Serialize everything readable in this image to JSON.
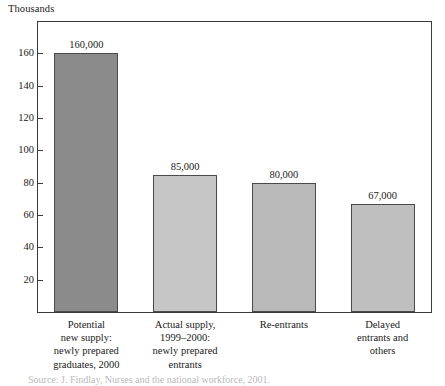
{
  "figure": {
    "units_label": "Thousands",
    "source_note": "Source: J. Findlay, Nurses and the national workforce, 2001.",
    "frame_color": "#3a3a3a"
  },
  "chart_data": {
    "type": "bar",
    "title": "",
    "subtitle": "",
    "xlabel": "",
    "ylabel": "Thousands",
    "ylim": [
      0,
      180
    ],
    "grid": false,
    "legend": "none",
    "yticks": [
      20,
      40,
      60,
      80,
      100,
      120,
      140,
      160
    ],
    "ytick_labels": [
      "20",
      "40",
      "60",
      "80",
      "100",
      "120",
      "140",
      "160"
    ],
    "categories": [
      "Potential\nnew supply:\nnewly prepared\ngraduates, 2000",
      "Actual supply,\n1999–2000:\nnewly prepared\nentrants",
      "Re-entrants",
      "Delayed\nentrants and\nothers"
    ],
    "values": [
      160,
      85,
      80,
      67
    ],
    "value_labels": [
      "160,000",
      "85,000",
      "80,000",
      "67,000"
    ],
    "bar_colors": [
      "#8b8b8b",
      "#c6c6c6",
      "#b9b9b9",
      "#bfbfbf"
    ],
    "bar_edge_color": "#4a4a4a",
    "units": "thousands"
  }
}
